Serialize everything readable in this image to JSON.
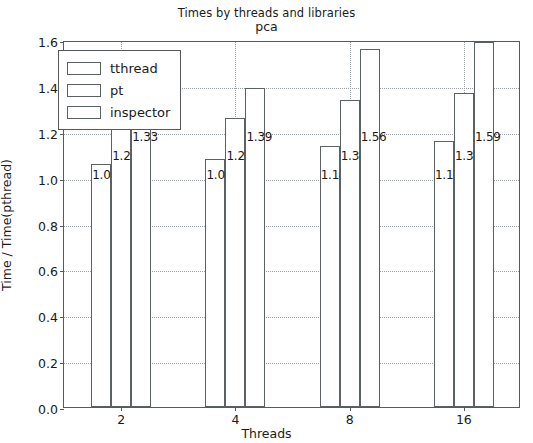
{
  "chart_data": {
    "type": "bar",
    "title": "Times by threads and libraries",
    "subtitle": "pca",
    "xlabel": "Threads",
    "ylabel": "Time / Time(pthread)",
    "categories": [
      "2",
      "4",
      "8",
      "16"
    ],
    "series": [
      {
        "name": "tthread",
        "values": [
          1.06,
          1.08,
          1.14,
          1.16
        ]
      },
      {
        "name": "pt",
        "values": [
          1.24,
          1.26,
          1.34,
          1.37
        ]
      },
      {
        "name": "inspector",
        "values": [
          1.33,
          1.39,
          1.56,
          1.59
        ]
      }
    ],
    "ylim": [
      0.0,
      1.6
    ],
    "yticks": [
      "0.0",
      "0.2",
      "0.4",
      "0.6",
      "0.8",
      "1.0",
      "1.2",
      "1.4",
      "1.6"
    ],
    "xticks": [
      "2",
      "4",
      "8",
      "16"
    ],
    "grid": true,
    "legend_position": "upper left",
    "bar_facecolor": "#ffffff",
    "bar_edgecolor": "#5c6164",
    "grid_color": "#9aa0a3",
    "axis_color": "#555b5e",
    "text_color": "#1a1a1a"
  }
}
